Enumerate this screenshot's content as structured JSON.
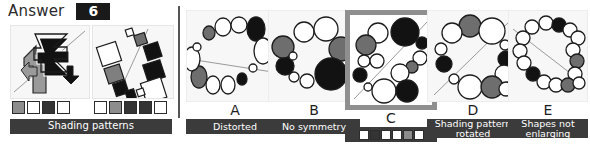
{
  "header": {
    "answer_label": "Answer",
    "answer_value": "6"
  },
  "stimulus": {
    "left_panel_name": "arrow-zigzag-figure",
    "right_panel_name": "rotated-squares-figure",
    "caption": "Shading patterns",
    "swatches_left": [
      "gray",
      "white",
      "dark",
      "white"
    ],
    "swatches_right": [
      "white",
      "gray",
      "dark",
      "dark",
      "white"
    ]
  },
  "options": [
    {
      "letter": "A",
      "caption": "Distorted",
      "caption_type": "text",
      "selected": false
    },
    {
      "letter": "B",
      "caption": "No symmetry",
      "caption_type": "text",
      "selected": false
    },
    {
      "letter": "C",
      "caption": "",
      "caption_type": "swatches",
      "caption_swatches": [
        "white",
        "dark",
        "white",
        "white",
        "gray",
        "white"
      ],
      "selected": true
    },
    {
      "letter": "D",
      "caption": "Shading pattern rotated",
      "caption_type": "text",
      "selected": false
    },
    {
      "letter": "E",
      "caption": "Shapes not enlarging",
      "caption_type": "text",
      "selected": false
    }
  ],
  "colors": {
    "dark": "#141414",
    "gray": "#8d8d8d",
    "white": "#ffffff",
    "caption_bg": "#3b3b3b",
    "selection_border": "#8f8f8f",
    "panel_bg": "#f7f7f7"
  }
}
